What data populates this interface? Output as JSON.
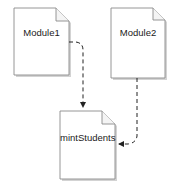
{
  "diagram": {
    "type": "dependency",
    "nodes": [
      {
        "id": "module1",
        "label": "Module1",
        "shape": "document"
      },
      {
        "id": "module2",
        "label": "Module2",
        "shape": "document"
      },
      {
        "id": "mintStudents",
        "label": "mintStudents",
        "shape": "document"
      }
    ],
    "edges": [
      {
        "from": "module1",
        "to": "mintStudents",
        "style": "dashed",
        "arrow": "end"
      },
      {
        "from": "module2",
        "to": "mintStudents",
        "style": "dashed",
        "arrow": "end"
      }
    ]
  },
  "colors": {
    "doc_fill": "#ffffff",
    "doc_stroke": "#8a8a8a",
    "doc_shadow": "#b5b5b5",
    "edge": "#222222",
    "text": "#1a1a1a"
  }
}
